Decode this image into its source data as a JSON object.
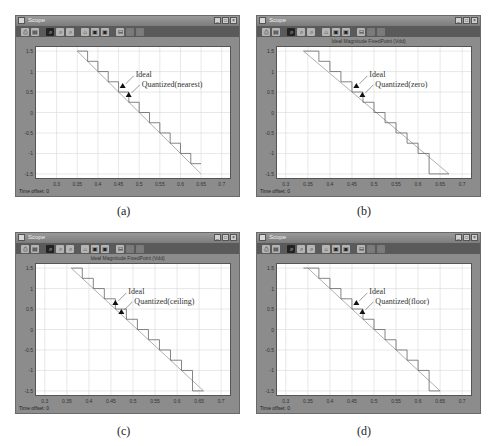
{
  "figure": {
    "panels": [
      {
        "id": "a",
        "caption": "(a)",
        "window_title": "Scope",
        "plot_title": "",
        "annotations": {
          "ideal": "Ideal",
          "quantized": "Quantized(nearest)"
        },
        "footer": "Time offset: 0",
        "mode": "nearest"
      },
      {
        "id": "b",
        "caption": "(b)",
        "window_title": "Scope",
        "plot_title": "Ideal Magnitude   FixedPoint (Vdd)",
        "annotations": {
          "ideal": "Ideal",
          "quantized": "Quantized(zero)"
        },
        "footer": "Time offset: 0",
        "mode": "zero"
      },
      {
        "id": "c",
        "caption": "(c)",
        "window_title": "Scope",
        "plot_title": "Ideal Magnitude   FixedPoint (Vdd)",
        "annotations": {
          "ideal": "Ideal",
          "quantized": "Quantized(ceiling)"
        },
        "footer": "Time offset: 0",
        "mode": "ceiling"
      },
      {
        "id": "d",
        "caption": "(d)",
        "window_title": "Scope",
        "plot_title": "",
        "annotations": {
          "ideal": "Ideal",
          "quantized": "Quantized(floor)"
        },
        "footer": "Time offset: 0",
        "mode": "floor"
      }
    ],
    "toolbar_icons": [
      "print-icon",
      "params-icon",
      "zoom-icon",
      "zoom-x-icon",
      "zoom-y-icon",
      "autoscale-icon",
      "save-axes-icon",
      "restore-axes-icon",
      "float-icon",
      "lock-icon",
      "signal-select-icon"
    ],
    "window_controls": [
      "_",
      "□",
      "×"
    ],
    "colors": {
      "window_frame": "#8c8c8c",
      "toolbar": "#5a5a5a",
      "plot_bg": "#ffffff",
      "grid": "#d8d8d8",
      "ideal_line": "#b0b0b0",
      "quantized_line": "#666666"
    }
  },
  "chart_data": [
    {
      "type": "line",
      "title": "Quantized(nearest)",
      "xlabel": "",
      "ylabel": "",
      "xlim": [
        0.25,
        0.72
      ],
      "ylim": [
        -1.6,
        1.6
      ],
      "xticks": [
        "0.3",
        "0.35",
        "0.4",
        "0.45",
        "0.5",
        "0.55",
        "0.6",
        "0.65",
        "0.7"
      ],
      "yticks": [
        "1.5",
        "1",
        "0.5",
        "0",
        "-0.5",
        "-1",
        "-1.5"
      ],
      "grid": true,
      "series": [
        {
          "name": "Ideal",
          "x": [
            0.35,
            0.65
          ],
          "y": [
            1.5,
            -1.5
          ]
        },
        {
          "name": "Quantized(nearest)",
          "x": [
            0.35,
            0.375,
            0.375,
            0.4,
            0.4,
            0.425,
            0.425,
            0.45,
            0.45,
            0.475,
            0.475,
            0.5,
            0.5,
            0.525,
            0.525,
            0.55,
            0.55,
            0.575,
            0.575,
            0.6,
            0.6,
            0.625,
            0.625,
            0.65
          ],
          "y": [
            1.5,
            1.5,
            1.25,
            1.25,
            1.0,
            1.0,
            0.75,
            0.75,
            0.5,
            0.5,
            0.25,
            0.25,
            0.0,
            0.0,
            -0.25,
            -0.25,
            -0.5,
            -0.5,
            -0.75,
            -0.75,
            -1.0,
            -1.0,
            -1.25,
            -1.25
          ]
        }
      ]
    },
    {
      "type": "line",
      "title": "Ideal Magnitude   FixedPoint (Vdd)",
      "xlim": [
        0.28,
        0.72
      ],
      "ylim": [
        -1.6,
        1.6
      ],
      "xticks": [
        "0.3",
        "0.35",
        "0.4",
        "0.45",
        "0.5",
        "0.55",
        "0.6",
        "0.65",
        "0.7"
      ],
      "yticks": [
        "1.5",
        "1",
        "0.5",
        "0",
        "-0.5",
        "-1",
        "-1.5"
      ],
      "grid": true,
      "series": [
        {
          "name": "Ideal",
          "x": [
            0.34,
            0.67
          ],
          "y": [
            1.5,
            -1.5
          ]
        },
        {
          "name": "Quantized(zero)",
          "x": [
            0.34,
            0.375,
            0.375,
            0.4,
            0.4,
            0.425,
            0.425,
            0.45,
            0.45,
            0.475,
            0.475,
            0.5,
            0.5,
            0.525,
            0.525,
            0.55,
            0.55,
            0.575,
            0.575,
            0.6,
            0.6,
            0.625,
            0.625,
            0.67
          ],
          "y": [
            1.5,
            1.5,
            1.25,
            1.25,
            1.0,
            1.0,
            0.75,
            0.75,
            0.5,
            0.5,
            0.25,
            0.25,
            0.0,
            0.0,
            -0.25,
            -0.25,
            -0.5,
            -0.5,
            -0.75,
            -0.75,
            -1.0,
            -1.0,
            -1.5,
            -1.5
          ]
        }
      ]
    },
    {
      "type": "line",
      "title": "Ideal Magnitude   FixedPoint (Vdd)",
      "xlim": [
        0.28,
        0.72
      ],
      "ylim": [
        -1.6,
        1.6
      ],
      "xticks": [
        "0.3",
        "0.35",
        "0.4",
        "0.45",
        "0.5",
        "0.55",
        "0.6",
        "0.65",
        "0.7"
      ],
      "yticks": [
        "1.5",
        "1",
        "0.5",
        "0",
        "-0.5",
        "-1",
        "-1.5"
      ],
      "grid": true,
      "series": [
        {
          "name": "Ideal",
          "x": [
            0.36,
            0.66
          ],
          "y": [
            1.5,
            -1.5
          ]
        },
        {
          "name": "Quantized(ceiling)",
          "x": [
            0.36,
            0.385,
            0.385,
            0.41,
            0.41,
            0.435,
            0.435,
            0.46,
            0.46,
            0.485,
            0.485,
            0.51,
            0.51,
            0.535,
            0.535,
            0.56,
            0.56,
            0.585,
            0.585,
            0.61,
            0.61,
            0.635,
            0.635,
            0.66
          ],
          "y": [
            1.5,
            1.5,
            1.25,
            1.25,
            1.0,
            1.0,
            0.75,
            0.75,
            0.5,
            0.5,
            0.25,
            0.25,
            0.0,
            0.0,
            -0.25,
            -0.25,
            -0.5,
            -0.5,
            -0.75,
            -0.75,
            -1.0,
            -1.0,
            -1.5,
            -1.5
          ]
        }
      ]
    },
    {
      "type": "line",
      "title": "Quantized(floor)",
      "xlim": [
        0.28,
        0.72
      ],
      "ylim": [
        -1.6,
        1.6
      ],
      "xticks": [
        "0.3",
        "0.35",
        "0.4",
        "0.45",
        "0.5",
        "0.55",
        "0.6",
        "0.65",
        "0.7"
      ],
      "yticks": [
        "1.5",
        "1",
        "0.5",
        "0",
        "-0.5",
        "-1",
        "-1.5"
      ],
      "grid": true,
      "series": [
        {
          "name": "Ideal",
          "x": [
            0.35,
            0.65
          ],
          "y": [
            1.5,
            -1.5
          ]
        },
        {
          "name": "Quantized(floor)",
          "x": [
            0.34,
            0.375,
            0.375,
            0.4,
            0.4,
            0.425,
            0.425,
            0.45,
            0.45,
            0.475,
            0.475,
            0.5,
            0.5,
            0.525,
            0.525,
            0.55,
            0.55,
            0.575,
            0.575,
            0.6,
            0.6,
            0.625,
            0.625,
            0.65
          ],
          "y": [
            1.5,
            1.5,
            1.25,
            1.25,
            1.0,
            1.0,
            0.75,
            0.75,
            0.5,
            0.5,
            0.25,
            0.25,
            0.0,
            0.0,
            -0.25,
            -0.25,
            -0.5,
            -0.5,
            -0.75,
            -0.75,
            -1.0,
            -1.0,
            -1.5,
            -1.5
          ]
        }
      ]
    }
  ]
}
